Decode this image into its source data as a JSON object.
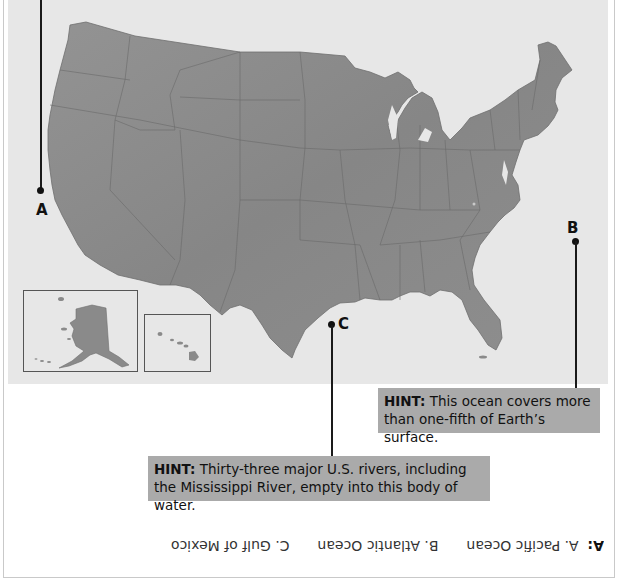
{
  "map": {
    "title": "United States map with labeled bodies of water",
    "land_color": "#8a8a8a",
    "background_color": "#e7e7e7",
    "insets": [
      {
        "name": "Alaska"
      },
      {
        "name": "Hawaii"
      }
    ]
  },
  "markers": [
    {
      "id": "A",
      "label": "A"
    },
    {
      "id": "B",
      "label": "B"
    },
    {
      "id": "C",
      "label": "C"
    }
  ],
  "hints": [
    {
      "for": "B",
      "prefix": "HINT:",
      "text": " This ocean covers more than one-fifth of Earth’s surface."
    },
    {
      "for": "C",
      "prefix": "HINT:",
      "text": " Thirty-three major U.S. rivers, including the Mississippi River, empty into this body of water."
    }
  ],
  "answer": {
    "prefix": "A:",
    "items": [
      "A. Pacific Ocean",
      "B. Atlantic Ocean",
      "C. Gulf of Mexico"
    ],
    "orientation": "upside-down"
  }
}
